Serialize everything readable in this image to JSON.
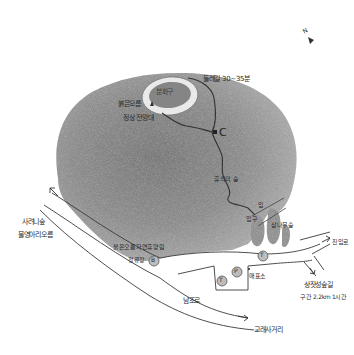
{
  "map": {
    "title": "",
    "colors": {
      "background": "#ffffff",
      "hill_shading": "#8f8f8f",
      "hill_dark": "#6e6e6e",
      "crater_rim": "#e6e6e6",
      "road_line": "#3a3a3a",
      "trail_line": "#3a3a3a",
      "forest": "#9a9a9a"
    },
    "compass": {
      "label": "N",
      "icon": "north-arrow-icon"
    },
    "landmarks": {
      "crater": "분화구",
      "summit_name": "붉은오름",
      "summit_viewpoint": "정상 전망대",
      "trail_time": "둘레길 30~35분",
      "checkpoint_c": "C",
      "rest_area": "휴식의 숲",
      "trail_entrance": "입구",
      "forest_stop": "삼나무숲",
      "recreation_forest": "붉은오름자연휴양림",
      "bus_stop": "정류장",
      "bus_marker": "B",
      "toilet_marker": "T",
      "parking_marker": "P",
      "ticket_marker": "T",
      "ticket_office": "매표소",
      "north_road_1": "사려니숲",
      "north_road_2": "물영아리오름",
      "east_road": "진입로",
      "south_road": "남조로",
      "intersection": "교래사거리",
      "forest_trail": "상잣성숲길",
      "forest_trail_info": "구간 2.2km 1시간",
      "entrance_marker": "입"
    }
  }
}
